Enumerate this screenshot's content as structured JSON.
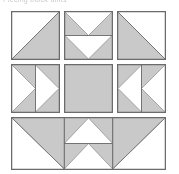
{
  "figure": {
    "caption": "Piecing block units",
    "width": 179,
    "height": 174,
    "background_color": "#ffffff",
    "shade_color": "#c9c9c9",
    "light_color": "#ffffff",
    "outline_color": "#6b6b6b",
    "seam_color": "#777777"
  },
  "diagram": {
    "type": "quilt-block-piecing-diagram",
    "grid": {
      "columns": 3,
      "rows": 3,
      "cell_size": 49,
      "gap": 4
    },
    "units": [
      {
        "id": "unit-r1c1",
        "name": "half-square-triangle-top-left",
        "position": {
          "row": 1,
          "column": 1
        },
        "x": 11,
        "y": 11,
        "width": 49,
        "height": 49,
        "pattern": "half-square-triangle",
        "shade_corner": "bottom-right",
        "description": "Half square triangle, shaded lower right"
      },
      {
        "id": "unit-r1c2",
        "name": "flying-geese-pair-down",
        "position": {
          "row": 1,
          "column": 2
        },
        "x": 64,
        "y": 11,
        "width": 49,
        "height": 49,
        "pattern": "flying-geese-stacked",
        "count": 2,
        "direction": "down",
        "description": "Two stacked flying geese units, light triangles point down"
      },
      {
        "id": "unit-r1c3",
        "name": "half-square-triangle-top-right",
        "position": {
          "row": 1,
          "column": 3
        },
        "x": 117,
        "y": 11,
        "width": 49,
        "height": 49,
        "pattern": "half-square-triangle",
        "shade_corner": "bottom-left",
        "description": "Half square triangle, shaded lower left"
      },
      {
        "id": "unit-r2c1",
        "name": "flying-geese-pair-right",
        "position": {
          "row": 2,
          "column": 1
        },
        "x": 11,
        "y": 64,
        "width": 49,
        "height": 49,
        "pattern": "flying-geese-side-by-side",
        "count": 2,
        "direction": "right",
        "description": "Two side by side flying geese units, light triangles point right"
      },
      {
        "id": "unit-r2c2",
        "name": "solid-center-square",
        "position": {
          "row": 2,
          "column": 2
        },
        "x": 64,
        "y": 64,
        "width": 49,
        "height": 49,
        "pattern": "solid-square",
        "fill": "shade",
        "description": "Plain shaded center square"
      },
      {
        "id": "unit-r2c3",
        "name": "flying-geese-pair-left",
        "position": {
          "row": 2,
          "column": 3
        },
        "x": 117,
        "y": 64,
        "width": 49,
        "height": 49,
        "pattern": "flying-geese-side-by-side",
        "count": 2,
        "direction": "left",
        "description": "Two side by side flying geese units, light triangles point left"
      },
      {
        "id": "unit-r3",
        "name": "bottom-row-strip",
        "position": {
          "row": 3,
          "column": "1-3"
        },
        "x": 11,
        "y": 117,
        "width": 155,
        "height": 53,
        "pattern": "composite-strip",
        "segments": [
          {
            "name": "large-triangle-left",
            "pattern": "half-square-triangle",
            "shade_corner": "top-right"
          },
          {
            "name": "flying-geese-pair-up",
            "pattern": "flying-geese-stacked",
            "count": 2,
            "direction": "up"
          },
          {
            "name": "large-triangle-right",
            "pattern": "half-square-triangle",
            "shade_corner": "top-left"
          }
        ],
        "description": "Full width strip: large shaded triangle, two stacked geese pointing up, large shaded triangle"
      }
    ]
  }
}
